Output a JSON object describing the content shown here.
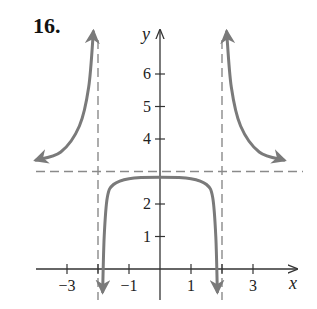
{
  "problem": {
    "number": "16."
  },
  "chart_data": {
    "type": "line",
    "title": "",
    "xlabel": "x",
    "ylabel": "y",
    "xlim": [
      -4,
      4.3
    ],
    "ylim": [
      -0.7,
      7.3
    ],
    "x_ticks": [
      -3,
      -1,
      1,
      3
    ],
    "x_minor_ticks": [
      -2,
      2
    ],
    "y_ticks": [
      1,
      2,
      4,
      5,
      6
    ],
    "asymptotes": {
      "vertical": [
        -2,
        2
      ],
      "horizontal": [
        3
      ]
    },
    "series": [
      {
        "name": "left branch",
        "points": [
          [
            -4.0,
            3.35
          ],
          [
            -3.2,
            3.6
          ],
          [
            -2.6,
            4.4
          ],
          [
            -2.3,
            5.6
          ],
          [
            -2.15,
            7.3
          ]
        ]
      },
      {
        "name": "middle branch",
        "points": [
          [
            -1.85,
            -0.7
          ],
          [
            -1.8,
            1.0
          ],
          [
            -1.7,
            2.2
          ],
          [
            -1.5,
            2.6
          ],
          [
            -1.0,
            2.78
          ],
          [
            0,
            2.82
          ],
          [
            1.0,
            2.78
          ],
          [
            1.5,
            2.6
          ],
          [
            1.7,
            2.2
          ],
          [
            1.8,
            1.0
          ],
          [
            1.85,
            -0.7
          ]
        ]
      },
      {
        "name": "right branch",
        "points": [
          [
            2.15,
            7.3
          ],
          [
            2.3,
            5.6
          ],
          [
            2.6,
            4.4
          ],
          [
            3.2,
            3.6
          ],
          [
            4.0,
            3.35
          ]
        ]
      }
    ]
  },
  "colors": {
    "curve": "#7a7a7a",
    "axis": "#333333",
    "asymptote": "#8a8a8a"
  }
}
